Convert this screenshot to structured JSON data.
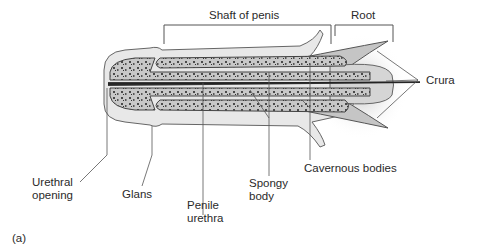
{
  "figure": {
    "panel_label": "(a)",
    "labels": {
      "shaft": "Shaft of penis",
      "root": "Root",
      "crura": "Crura",
      "cavernous": "Cavernous bodies",
      "spongy_1": "Spongy",
      "spongy_2": "body",
      "penile_1": "Penile",
      "penile_2": "urethra",
      "glans": "Glans",
      "urethral_1": "Urethral",
      "urethral_2": "opening"
    },
    "colors": {
      "tissue": "#c9c9c9",
      "tissue_dark": "#8a8a8a",
      "outline": "#555555",
      "leader": "#555555"
    }
  }
}
